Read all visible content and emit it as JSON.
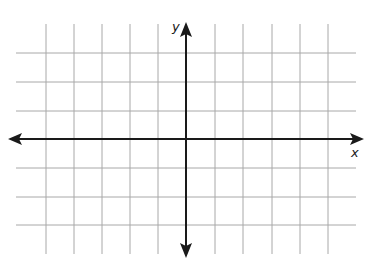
{
  "diagram": {
    "type": "coordinate-plane",
    "axes": {
      "x_label": "x",
      "y_label": "y",
      "origin_px": [
        186,
        139
      ]
    },
    "grid": {
      "spacing_px": 28.5,
      "vertical_lines_x": [
        46,
        74,
        102,
        130,
        158,
        215,
        243,
        272,
        300,
        328
      ],
      "horizontal_lines_y": [
        53,
        82,
        111,
        168,
        197,
        225
      ],
      "x_extent": [
        16,
        356
      ],
      "y_extent": [
        24,
        254
      ],
      "units_left": 5,
      "units_right": 5,
      "units_up": 3,
      "units_down": 3
    },
    "colors": {
      "grid": "#a8a8a8",
      "axis": "#1a1a1a",
      "background": "#ffffff"
    }
  }
}
